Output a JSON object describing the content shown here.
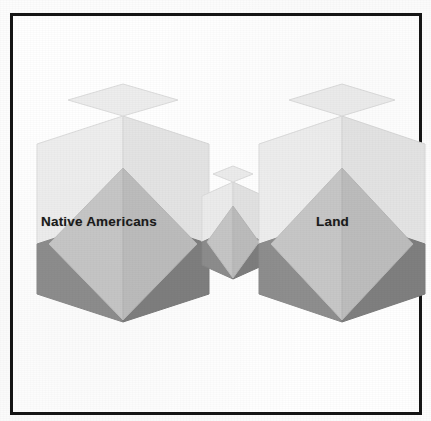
{
  "figure": {
    "type": "concept-diagram",
    "background_color": "#ffffff",
    "frame": {
      "name": "outer-border",
      "color": "#161616",
      "thickness_px": 3
    },
    "nodes": [
      {
        "id": "native-americans",
        "label": "Native Americans",
        "shape": "isometric-cube",
        "size": "large",
        "position": "left"
      },
      {
        "id": "connector",
        "label": "",
        "shape": "isometric-cube",
        "size": "small",
        "position": "center"
      },
      {
        "id": "land",
        "label": "Land",
        "shape": "isometric-cube",
        "size": "large",
        "position": "right"
      }
    ],
    "palette": {
      "face_top": "#e9e9e9",
      "face_left": "#efefef",
      "face_right": "#e3e3e3",
      "diamond": "#c4c4c4",
      "diamond_shade": "#bdbdbd",
      "shadow_dark": "#8e8e8e",
      "shadow_darker": "#7a7a7a",
      "outline": "#d2d2d2",
      "label_color": "#1b1b1b"
    },
    "labels": {
      "left_node": "Native Americans",
      "right_node": "Land"
    }
  }
}
